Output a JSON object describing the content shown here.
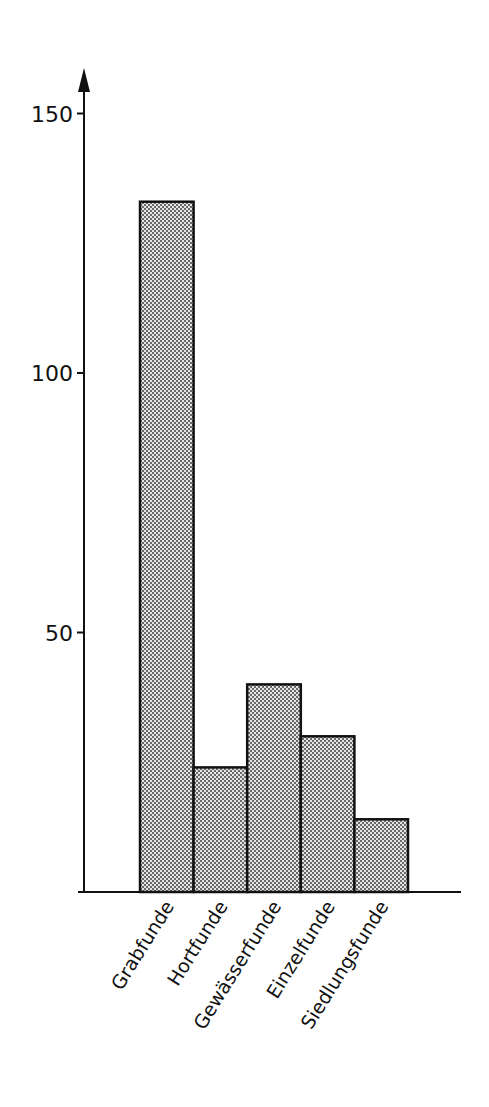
{
  "chart_data": {
    "type": "bar",
    "title": "",
    "xlabel": "",
    "ylabel": "",
    "categories": [
      "Grabfunde",
      "Hortfunde",
      "Gewässerfunde",
      "Einzelfunde",
      "Siedlungsfunde"
    ],
    "values": [
      133,
      24,
      40,
      30,
      14
    ],
    "ylim": [
      0,
      160
    ],
    "yticks": [
      50,
      100,
      150
    ],
    "ytick_labels": [
      "50",
      "100",
      "150"
    ],
    "grid": false,
    "legend": null,
    "bar_fill": "dotted grey pattern",
    "bar_edge_color": "#111111",
    "y_axis_arrow": true
  }
}
